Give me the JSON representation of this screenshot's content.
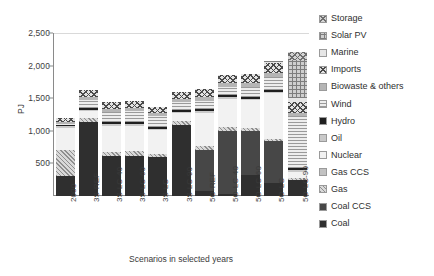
{
  "chart_data": {
    "type": "bar",
    "subtype": "stacked-vertical",
    "title": "",
    "xlabel": "Scenarios in selected years",
    "ylabel": "PJ",
    "ylim": [
      0,
      2500
    ],
    "ytick_values": [
      0,
      500,
      1000,
      1500,
      2000,
      2500
    ],
    "ytick_labels": [
      "0",
      "500",
      "1,000",
      "1,500",
      "2,000",
      "2,500"
    ],
    "grid": false,
    "legend_position": "right",
    "categories": [
      "2000",
      "3S-REF",
      "3S-LC-40",
      "3S-LC-60",
      "3S-LC",
      "3S-LC-90",
      "5O-REF",
      "5O-LC-40",
      "5O-LC-60",
      "5O-LC",
      "5O-LC-90"
    ],
    "series": [
      {
        "name": "Coal",
        "key": "coal",
        "fill": "f-coal",
        "color": "#2f2f2f",
        "values": [
          300,
          1140,
          620,
          620,
          600,
          1090,
          75,
          25,
          320,
          200,
          240
        ]
      },
      {
        "name": "Coal CCS",
        "key": "coalccs",
        "fill": "f-coalccs",
        "color": "#474747",
        "values": [
          0,
          0,
          0,
          0,
          0,
          0,
          625,
          975,
          680,
          640,
          0
        ]
      },
      {
        "name": "Gas",
        "key": "gas",
        "fill": "f-gas",
        "color": "#d9d9d9",
        "values": [
          410,
          60,
          60,
          70,
          50,
          55,
          70,
          60,
          40,
          35,
          35
        ]
      },
      {
        "name": "Gas CCS",
        "key": "gasccs",
        "fill": "f-gasccs",
        "color": "#c2c2c2",
        "values": [
          0,
          0,
          0,
          0,
          0,
          0,
          0,
          0,
          0,
          0,
          0
        ]
      },
      {
        "name": "Nuclear",
        "key": "nuclear",
        "fill": "f-nuclear",
        "color": "#f2f2f2",
        "values": [
          330,
          100,
          395,
          390,
          360,
          125,
          500,
          430,
          430,
          700,
          100
        ]
      },
      {
        "name": "Oil",
        "key": "oil",
        "fill": "f-oil",
        "color": "#c9c9c9",
        "values": [
          30,
          20,
          25,
          25,
          25,
          25,
          30,
          25,
          25,
          25,
          25
        ]
      },
      {
        "name": "Hydro",
        "key": "hydro",
        "fill": "f-hydro",
        "color": "#1f1f1f",
        "values": [
          30,
          30,
          30,
          30,
          30,
          30,
          30,
          30,
          30,
          30,
          30
        ]
      },
      {
        "name": "Wind",
        "key": "wind",
        "fill": "f-wind",
        "color": "#ededed",
        "values": [
          5,
          130,
          160,
          170,
          165,
          120,
          130,
          130,
          150,
          200,
          790
        ]
      },
      {
        "name": "Biowaste & others",
        "key": "biowaste",
        "fill": "f-biowaste",
        "color": "#b5b5b5",
        "values": [
          35,
          45,
          50,
          50,
          50,
          50,
          55,
          55,
          55,
          60,
          60
        ]
      },
      {
        "name": "Imports",
        "key": "imports",
        "fill": "f-imports",
        "color": "#e3e3e3",
        "values": [
          60,
          100,
          110,
          110,
          85,
          100,
          120,
          125,
          140,
          150,
          170
        ]
      },
      {
        "name": "Marine",
        "key": "marine",
        "fill": "f-marine",
        "color": "#e6e6e6",
        "values": [
          0,
          0,
          0,
          0,
          0,
          0,
          0,
          0,
          0,
          20,
          60
        ]
      },
      {
        "name": "Solar PV",
        "key": "solarpv",
        "fill": "f-solarpv",
        "color": "#cfcfcf",
        "values": [
          0,
          0,
          0,
          0,
          0,
          0,
          0,
          0,
          0,
          10,
          580
        ]
      },
      {
        "name": "Storage",
        "key": "storage",
        "fill": "f-storage",
        "color": "#d4d4d4",
        "values": [
          0,
          0,
          0,
          0,
          0,
          0,
          0,
          0,
          0,
          0,
          120
        ]
      }
    ],
    "totals": [
      1200,
      1625,
      1450,
      1465,
      1365,
      1595,
      1635,
      1855,
      1870,
      2070,
      2210
    ]
  },
  "legend": {
    "items": [
      {
        "label": "Storage",
        "fill": "f-storage"
      },
      {
        "label": "Solar PV",
        "fill": "f-solarpv"
      },
      {
        "label": "Marine",
        "fill": "f-marine"
      },
      {
        "label": "Imports",
        "fill": "f-imports"
      },
      {
        "label": "Biowaste & others",
        "fill": "f-biowaste"
      },
      {
        "label": "Wind",
        "fill": "f-wind"
      },
      {
        "label": "Hydro",
        "fill": "f-hydro"
      },
      {
        "label": "Oil",
        "fill": "f-oil"
      },
      {
        "label": "Nuclear",
        "fill": "f-nuclear"
      },
      {
        "label": "Gas CCS",
        "fill": "f-gasccs"
      },
      {
        "label": "Gas",
        "fill": "f-gas"
      },
      {
        "label": "Coal CCS",
        "fill": "f-coalccs"
      },
      {
        "label": "Coal",
        "fill": "f-coal"
      }
    ]
  }
}
